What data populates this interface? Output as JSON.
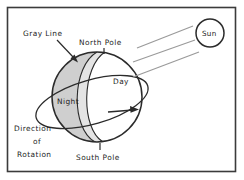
{
  "figure": {
    "background_color": "#ffffff",
    "border_color": "#3b3b3b"
  },
  "labels": {
    "gray_line": "Gray Line",
    "north_pole": "North Pole",
    "day": "Day",
    "night": "Night",
    "south_pole": "South Pole",
    "direction_line1": "Direction",
    "direction_line2": "of",
    "direction_line3": "Rotation",
    "sun": "Sun"
  },
  "colors": {
    "outline": "#2b2b2b",
    "night_fill": "#cfcfcf",
    "grayline_fill": "#e4e4e4",
    "day_fill": "#ffffff",
    "ray": "#9a9a9a",
    "text": "#1d1d1d"
  },
  "geometry": {
    "earth_center_x": 97,
    "earth_center_y": 97,
    "earth_radius": 45,
    "sun_center_x": 210,
    "sun_center_y": 33,
    "sun_radius": 14,
    "sun_ray_count": 3
  }
}
